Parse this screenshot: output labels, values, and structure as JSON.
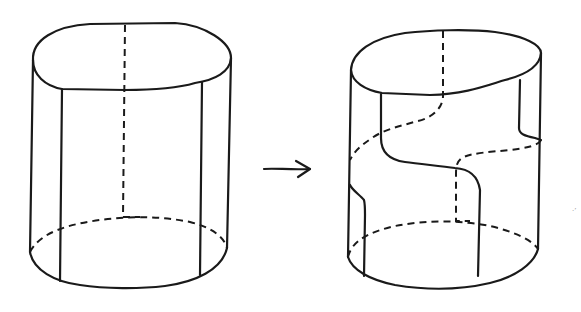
{
  "figure": {
    "left_panel": {
      "label": "original cylinder",
      "seams": "two straight vertical front seams, one dashed vertical back seam"
    },
    "arrow": {
      "direction": "right",
      "meaning": "transforms to"
    },
    "right_panel": {
      "label": "twisted cylinder",
      "seams": "S-shaped seams wrapping around the surface, dashed where hidden"
    },
    "speck_text": "·’"
  },
  "colors": {
    "line": "#1a1a1a",
    "background": "#ffffff"
  }
}
